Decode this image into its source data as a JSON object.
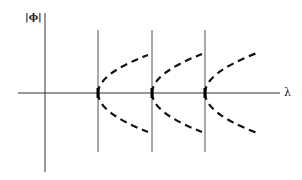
{
  "diagram": {
    "y_axis_label": "|ϕ|",
    "x_axis_label": "λ",
    "colors": {
      "axis": "#333333",
      "bifurcation_line": "#555555",
      "branch": "#111111",
      "background": "#ffffff"
    },
    "axes": {
      "x_axis": {
        "x1": 18,
        "x2": 280,
        "y": 93
      },
      "y_axis": {
        "x": 45,
        "y1": 13,
        "y2": 172
      }
    },
    "bifurcation_points": [
      {
        "label": "λ1",
        "x": 98,
        "y_top": 30,
        "y_bottom": 152,
        "branch_end_x": 148,
        "upper_end_y": 55,
        "lower_end_y": 132
      },
      {
        "label": "λ2",
        "x": 152,
        "y_top": 30,
        "y_bottom": 152,
        "branch_end_x": 202,
        "upper_end_y": 54,
        "lower_end_y": 132
      },
      {
        "label": "λ3",
        "x": 205,
        "y_top": 30,
        "y_bottom": 152,
        "branch_end_x": 257,
        "upper_end_y": 53,
        "lower_end_y": 133
      }
    ],
    "branch_style": "dashed",
    "branch_shape": "parabola opening rightward (pitchfork)"
  }
}
